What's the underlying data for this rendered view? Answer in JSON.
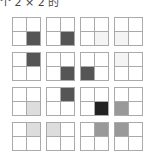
{
  "caption": "个 2 × 2 的",
  "layout": {
    "x": [
      12,
      46,
      80,
      114
    ],
    "y": [
      17,
      52,
      87,
      122
    ]
  },
  "grids": [
    [
      [
        "#ffffff",
        "#ffffff",
        "#ffffff",
        "#555555"
      ],
      [
        "#ffffff",
        "#ffffff",
        "#ffffff",
        "#555555"
      ],
      [
        "#ffffff",
        "#ffffff",
        "#ffffff",
        "#f4f4f4"
      ],
      [
        "#ffffff",
        "#ffffff",
        "#f4f4f4",
        "#ffffff"
      ]
    ],
    [
      [
        "#ffffff",
        "#555555",
        "#ffffff",
        "#ffffff"
      ],
      [
        "#ffffff",
        "#ffffff",
        "#ffffff",
        "#555555"
      ],
      [
        "#ffffff",
        "#ffffff",
        "#555555",
        "#ffffff"
      ],
      [
        "#f4f4f4",
        "#ffffff",
        "#ffffff",
        "#ffffff"
      ]
    ],
    [
      [
        "#ffffff",
        "#ffffff",
        "#ffffff",
        "#dddddd"
      ],
      [
        "#ffffff",
        "#555555",
        "#ffffff",
        "#ffffff"
      ],
      [
        "#ffffff",
        "#ffffff",
        "#ffffff",
        "#222222"
      ],
      [
        "#ffffff",
        "#ffffff",
        "#999999",
        "#ffffff"
      ]
    ],
    [
      [
        "#ffffff",
        "#dddddd",
        "#ffffff",
        "#ffffff"
      ],
      [
        "#dddddd",
        "#ffffff",
        "#ffffff",
        "#ffffff"
      ],
      [
        "#ffffff",
        "#999999",
        "#ffffff",
        "#ffffff"
      ],
      [
        "#999999",
        "#ffffff",
        "#ffffff",
        "#ffffff"
      ]
    ]
  ]
}
